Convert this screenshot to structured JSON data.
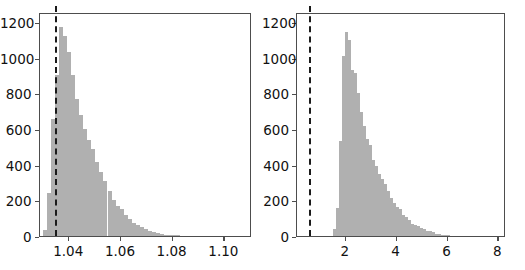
{
  "figure": {
    "width": 525,
    "height": 270,
    "background": "#ffffff",
    "bar_color": "#b0b0b0",
    "axis_color": "#4d4d4d",
    "vline_color": "#1a1a1a"
  },
  "chart_data": [
    {
      "type": "bar",
      "chart_kind": "histogram",
      "panel": "left",
      "title": "",
      "xlabel": "",
      "ylabel": "",
      "xlim": [
        1.0285,
        1.1105
      ],
      "ylim": [
        0,
        1255
      ],
      "xticks": [
        1.04,
        1.06,
        1.08,
        1.1
      ],
      "xticklabels": [
        "1.04",
        "1.06",
        "1.08",
        "1.10"
      ],
      "yticks": [
        0,
        200,
        400,
        600,
        800,
        1000,
        1200
      ],
      "yticklabels": [
        "0",
        "200",
        "400",
        "600",
        "800",
        "1000",
        "1200"
      ],
      "grid": false,
      "legend": null,
      "bin_width": 0.00155,
      "bin_left_edges": [
        1.03,
        1.03155,
        1.0331,
        1.03465,
        1.0362,
        1.03775,
        1.0393,
        1.04085,
        1.0424,
        1.04395,
        1.0455,
        1.04705,
        1.0486,
        1.05015,
        1.0517,
        1.05325,
        1.0548,
        1.05635,
        1.0579,
        1.05945,
        1.061,
        1.06255,
        1.0641,
        1.06565,
        1.0672,
        1.06875,
        1.0703,
        1.07185,
        1.0734,
        1.07495,
        1.0765,
        1.07805,
        1.0796,
        1.08115,
        1.0827,
        1.08425,
        1.0858,
        1.08735,
        1.0889,
        1.09045,
        1.092,
        1.09355,
        1.0951,
        1.09665,
        1.0982,
        1.09975,
        1.1013,
        1.10285,
        1.1044,
        1.10595
      ],
      "values": [
        35,
        240,
        655,
        900,
        1170,
        1120,
        1030,
        900,
        770,
        680,
        600,
        540,
        490,
        415,
        360,
        310,
        255,
        200,
        170,
        150,
        120,
        95,
        75,
        60,
        48,
        38,
        30,
        22,
        16,
        11,
        8,
        6,
        4,
        3,
        2,
        2,
        1,
        1,
        1,
        1,
        0,
        0,
        0,
        0,
        0,
        0,
        0,
        0,
        0,
        0
      ],
      "annotations": [
        {
          "kind": "vertical-dashed-line",
          "x": 1.0345,
          "style": "dashed",
          "color": "#1a1a1a"
        }
      ]
    },
    {
      "type": "bar",
      "chart_kind": "histogram",
      "panel": "right",
      "title": "",
      "xlabel": "",
      "ylabel": "",
      "xlim": [
        0.08,
        8.3
      ],
      "ylim": [
        0,
        1255
      ],
      "xticks": [
        2,
        4,
        6,
        8
      ],
      "xticklabels": [
        "2",
        "4",
        "6",
        "8"
      ],
      "yticks": [
        0,
        200,
        400,
        600,
        800,
        1000,
        1200
      ],
      "yticklabels": [
        "0",
        "200",
        "400",
        "600",
        "800",
        "1000",
        "1200"
      ],
      "grid": false,
      "legend": null,
      "bin_width": 0.1175,
      "bin_left_edges": [
        1.5,
        1.6175,
        1.735,
        1.8525,
        1.97,
        2.0875,
        2.205,
        2.3225,
        2.44,
        2.5575,
        2.675,
        2.7925,
        2.91,
        3.0275,
        3.145,
        3.2625,
        3.38,
        3.4975,
        3.615,
        3.7325,
        3.85,
        3.9675,
        4.085,
        4.2025,
        4.32,
        4.4375,
        4.555,
        4.6725,
        4.79,
        4.9075,
        5.025,
        5.1425,
        5.26,
        5.3775,
        5.495,
        5.6125,
        5.73,
        5.8475,
        5.965,
        6.0825,
        6.2,
        6.3175,
        6.435,
        6.5525,
        6.67
      ],
      "values": [
        40,
        155,
        530,
        1010,
        1145,
        1100,
        930,
        915,
        800,
        695,
        615,
        545,
        510,
        425,
        390,
        350,
        320,
        290,
        250,
        215,
        185,
        160,
        150,
        120,
        105,
        90,
        70,
        60,
        55,
        45,
        38,
        30,
        26,
        20,
        14,
        10,
        6,
        4,
        3,
        2,
        1,
        1,
        0,
        0,
        0
      ],
      "annotations": [
        {
          "kind": "vertical-dashed-line",
          "x": 0.55,
          "style": "dashed",
          "color": "#1a1a1a"
        }
      ]
    }
  ]
}
